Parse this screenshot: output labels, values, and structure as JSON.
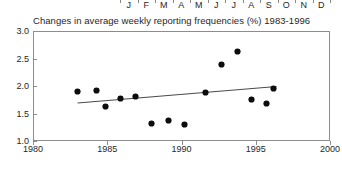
{
  "month_axis": {
    "name": "month-axis-strip",
    "labels": [
      "J",
      "F",
      "M",
      "A",
      "M",
      "J",
      "J",
      "A",
      "S",
      "O",
      "N",
      "D"
    ],
    "tick_count": 13
  },
  "chart_data": {
    "type": "scatter",
    "title": "Changes in average weekly reporting frequencies (%) 1983-1996",
    "xlabel": "",
    "ylabel": "",
    "xlim": [
      1980,
      2000
    ],
    "ylim": [
      1.0,
      3.0
    ],
    "xticks": [
      1980,
      1985,
      1990,
      1995,
      2000
    ],
    "xtick_labels": [
      "1980",
      "1985",
      "1990",
      "1995",
      "2000"
    ],
    "yticks": [
      1.0,
      1.5,
      2.0,
      2.5,
      3.0
    ],
    "ytick_labels": [
      "1.0",
      "1.5",
      "2.0",
      "2.5",
      "3.0"
    ],
    "grid": false,
    "legend": null,
    "marker": "filled-diamond",
    "marker_color": "#0d0d0d",
    "frame_color": "#8d8d8d",
    "points": [
      {
        "x": 1983.0,
        "y": 1.9
      },
      {
        "x": 1984.3,
        "y": 1.92
      },
      {
        "x": 1984.9,
        "y": 1.63
      },
      {
        "x": 1985.9,
        "y": 1.78
      },
      {
        "x": 1986.9,
        "y": 1.81
      },
      {
        "x": 1988.0,
        "y": 1.31
      },
      {
        "x": 1989.1,
        "y": 1.38
      },
      {
        "x": 1990.2,
        "y": 1.3
      },
      {
        "x": 1991.6,
        "y": 1.89
      },
      {
        "x": 1992.7,
        "y": 2.4
      },
      {
        "x": 1993.8,
        "y": 2.63
      },
      {
        "x": 1994.7,
        "y": 1.76
      },
      {
        "x": 1995.7,
        "y": 1.68
      },
      {
        "x": 1996.2,
        "y": 1.95
      }
    ],
    "trend_line": {
      "name": "linear-fit",
      "color": "#4a4a4a",
      "x_start": 1983.0,
      "y_start": 1.69,
      "x_end": 1996.4,
      "y_end": 1.99
    }
  }
}
